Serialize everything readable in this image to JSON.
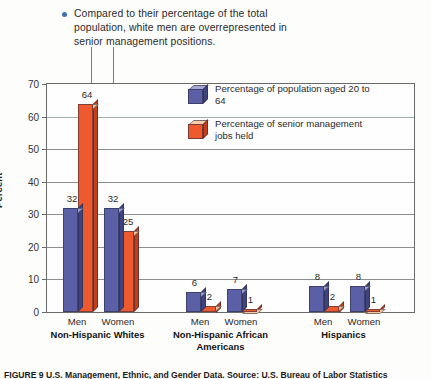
{
  "annotation": {
    "bullet_icon": "bullet-dot",
    "text": "Compared to their percentage of the total population, white men are overrepresented in senior management positions."
  },
  "axis": {
    "ylabel": "Percent",
    "yticks": [
      "70",
      "60",
      "50",
      "40",
      "30",
      "20",
      "10",
      "0"
    ]
  },
  "legend": {
    "items": [
      {
        "icon": "blue-cube-icon",
        "label": "Percentage of population aged 20 to 64",
        "color": "#5a5fa6"
      },
      {
        "icon": "orange-cube-icon",
        "label": "Percentage of senior management jobs held",
        "color": "#ee5a2e"
      }
    ]
  },
  "caption": {
    "text": "FIGURE 9   U.S. Management, Ethnic, and Gender Data. Source: U.S. Bureau of Labor Statistics"
  },
  "chart_data": {
    "type": "bar",
    "title": "",
    "xlabel": "",
    "ylabel": "Percent",
    "ylim": [
      0,
      70
    ],
    "ytick_step": 10,
    "grid": true,
    "legend_position": "inside-top-right",
    "groups": [
      {
        "name": "Non-Hispanic Whites",
        "subcategories": [
          "Men",
          "Women"
        ]
      },
      {
        "name": "Non-Hispanic African Americans",
        "subcategories": [
          "Men",
          "Women"
        ]
      },
      {
        "name": "Hispanics",
        "subcategories": [
          "Men",
          "Women"
        ]
      }
    ],
    "categories": [
      "Non-Hispanic Whites Men",
      "Non-Hispanic Whites Women",
      "Non-Hispanic African Americans Men",
      "Non-Hispanic African Americans Women",
      "Hispanics Men",
      "Hispanics Women"
    ],
    "series": [
      {
        "name": "Percentage of population aged 20 to 64",
        "color": "#5a5fa6",
        "values": [
          32,
          32,
          6,
          7,
          8,
          8
        ]
      },
      {
        "name": "Percentage of senior management jobs held",
        "color": "#ee5a2e",
        "values": [
          64,
          25,
          2,
          1,
          2,
          1
        ]
      }
    ]
  }
}
